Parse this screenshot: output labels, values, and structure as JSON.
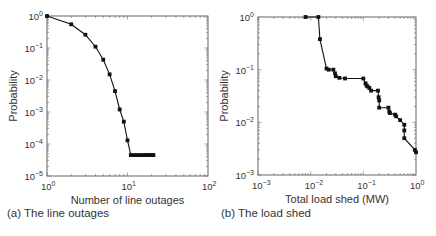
{
  "chart_data": [
    {
      "id": "a",
      "type": "line",
      "caption": "(a) The line outages",
      "title": "",
      "xlabel": "Number of line outages",
      "ylabel": "Probability",
      "xscale": "log",
      "yscale": "log",
      "xlim": [
        1,
        100
      ],
      "ylim": [
        1e-05,
        1
      ],
      "x_ticks": [
        {
          "base": "10",
          "exp": "0"
        },
        {
          "base": "10",
          "exp": "1"
        },
        {
          "base": "10",
          "exp": "2"
        }
      ],
      "y_ticks": [
        {
          "base": "10",
          "exp": "0"
        },
        {
          "base": "10",
          "exp": "−1"
        },
        {
          "base": "10",
          "exp": "−2"
        },
        {
          "base": "10",
          "exp": "−3"
        },
        {
          "base": "10",
          "exp": "−4"
        },
        {
          "base": "10",
          "exp": "−5"
        }
      ],
      "grid": false,
      "legend": null,
      "marker": "square",
      "color": "#111111",
      "x": [
        1,
        2,
        3,
        4,
        5,
        6,
        7,
        8,
        9,
        10,
        11,
        12,
        13,
        14,
        15,
        16,
        17,
        18,
        19,
        20,
        21
      ],
      "values": [
        1.0,
        0.55,
        0.26,
        0.11,
        0.043,
        0.015,
        0.0045,
        0.0012,
        0.0005,
        0.00013,
        4.5e-05,
        4.5e-05,
        4.5e-05,
        4.5e-05,
        4.5e-05,
        4.5e-05,
        4.5e-05,
        4.5e-05,
        4.5e-05,
        4.5e-05,
        4.5e-05
      ]
    },
    {
      "id": "b",
      "type": "line",
      "caption": "(b) The load shed",
      "title": "",
      "xlabel": "Total load shed (MW)",
      "ylabel": "Probability",
      "xscale": "log",
      "yscale": "log",
      "xlim": [
        0.001,
        1
      ],
      "ylim": [
        0.001,
        1
      ],
      "x_ticks": [
        {
          "base": "10",
          "exp": "−3"
        },
        {
          "base": "10",
          "exp": "−2"
        },
        {
          "base": "10",
          "exp": "−1"
        },
        {
          "base": "10",
          "exp": "0"
        }
      ],
      "y_ticks": [
        {
          "base": "10",
          "exp": "0"
        },
        {
          "base": "10",
          "exp": "−1"
        },
        {
          "base": "10",
          "exp": "−2"
        },
        {
          "base": "10",
          "exp": "−3"
        }
      ],
      "grid": false,
      "legend": null,
      "marker": "square",
      "color": "#111111",
      "x": [
        0.008,
        0.014,
        0.015,
        0.02,
        0.022,
        0.027,
        0.029,
        0.03,
        0.035,
        0.045,
        0.1,
        0.11,
        0.115,
        0.12,
        0.13,
        0.14,
        0.19,
        0.195,
        0.2,
        0.2,
        0.3,
        0.31,
        0.32,
        0.4,
        0.42,
        0.5,
        0.6,
        0.6,
        0.6,
        0.95,
        1.0
      ],
      "values": [
        1.0,
        1.0,
        0.38,
        0.105,
        0.1,
        0.1,
        0.085,
        0.075,
        0.07,
        0.068,
        0.068,
        0.055,
        0.05,
        0.048,
        0.045,
        0.04,
        0.04,
        0.03,
        0.026,
        0.019,
        0.019,
        0.016,
        0.015,
        0.014,
        0.013,
        0.011,
        0.009,
        0.007,
        0.005,
        0.003,
        0.0027
      ]
    }
  ]
}
